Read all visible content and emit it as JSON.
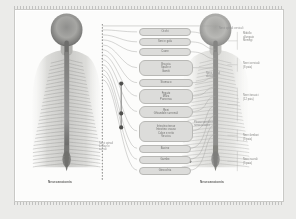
{
  "document": {
    "type": "anatomical-diagram",
    "subject": "Spinal cord and spinal nerve segments — posterior views",
    "language": "it",
    "background_color": "#fcfcfb",
    "paper_border_color": "#c9c9c6",
    "box_fill_color": "#dcdcda",
    "box_border_color": "#b8b8b5",
    "line_color": "#9a9a98",
    "node_color": "#5a5a58"
  },
  "captions": {
    "left": "Neuroanatomia",
    "right": "Neuroanatomia"
  },
  "center_boxes": [
    {
      "id": "b1",
      "label": "Occhi"
    },
    {
      "id": "b2",
      "label": "Seni e gola"
    },
    {
      "id": "b3",
      "label": "Cuore"
    },
    {
      "id": "b4",
      "label": "Braccia\nSpalle e\nGomiti"
    },
    {
      "id": "b5",
      "label": "Stomaco"
    },
    {
      "id": "b6",
      "label": "Fegato\nMilza\nPancreas"
    },
    {
      "id": "b7",
      "label": "Reni\nGhiandole surrenali"
    },
    {
      "id": "b8",
      "label": "Intestino tenue\nIntestino crasso\nColon e retto\nVescica"
    },
    {
      "id": "b9",
      "label": "Bacino"
    },
    {
      "id": "b10",
      "label": "Gambe"
    },
    {
      "id": "b11",
      "label": "Ginocchia"
    }
  ],
  "annotations": {
    "top_right": "Nervi spinali cervicali",
    "mid_right": "Nervi spinali\ndorsali",
    "lower_right": "Plesso sacrale e\nnervo sciatico",
    "lower_left": "Nervi spinali\nlombari e\nsacrali"
  },
  "right_side_labels": [
    {
      "label": "Midollo\nallungato\nMeningi"
    },
    {
      "label": "Nervi cervicali\n(8 paia)"
    },
    {
      "label": "Nervi toracici\n(12 paia)"
    },
    {
      "label": "Nervi lombari\n(5 paia)"
    },
    {
      "label": "Nervi sacrali\n(5 paia)"
    }
  ],
  "chart_data": {
    "type": "diagram",
    "nodes": 11,
    "junction_nodes": 3,
    "left_rail_segments": 31,
    "right_bracket_groups": 5
  }
}
